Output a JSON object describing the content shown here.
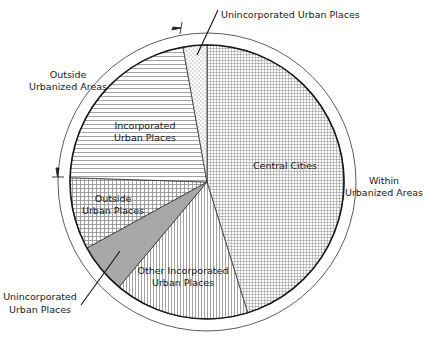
{
  "chart_data": {
    "type": "pie",
    "title": "",
    "start_angle_deg": 0,
    "direction": "clockwise",
    "slices": [
      {
        "label": "Central Cities",
        "value": 45.2,
        "pattern": "fine-grid",
        "group": "Within Urbanized Areas"
      },
      {
        "label": "Other Incorporated Urban Places",
        "value": 15.9,
        "pattern": "vertical-lines",
        "group": "Outside Urbanized Areas"
      },
      {
        "label": "Unincorporated Urban Places",
        "value": 5.9,
        "pattern": "solid-gray",
        "group": "Outside Urbanized Areas"
      },
      {
        "label": "Outside Urban Places",
        "value": 8.5,
        "pattern": "coarse-grid",
        "group": "Outside Urbanized Areas"
      },
      {
        "label": "Incorporated Urban Places",
        "value": 21.7,
        "pattern": "horizontal-lines",
        "group": "Within Urbanized Areas"
      },
      {
        "label": "Unincorporated Urban Places",
        "value": 2.8,
        "pattern": "dots",
        "group": "Within Urbanized Areas"
      }
    ],
    "group_labels": [
      {
        "label": "Within Urbanized Areas"
      },
      {
        "label": "Outside Urbanized Areas"
      }
    ],
    "legend": "none",
    "value_units": "percent (estimated from slice angles)"
  },
  "labels": {
    "central_cities": "Central Cities",
    "other_incorporated_l1": "Other Incorporated",
    "other_incorporated_l2": "Urban Places",
    "outside_urban_l1": "Outside",
    "outside_urban_l2": "Urban Places",
    "incorporated_l1": "Incorporated",
    "incorporated_l2": "Urban Places",
    "unincorporated_top": "Unincorporated Urban Places",
    "unincorporated_bottom_l1": "Unincorporated",
    "unincorporated_bottom_l2": "Urban Places",
    "within_l1": "Within",
    "within_l2": "Urbanized Areas",
    "outside_l1": "Outside",
    "outside_l2": "Urbanized Areas"
  },
  "colors": {
    "outline": "#1a1a1a",
    "pattern_ink": "#7a7a7a",
    "solid_gray": "#a8a8a8",
    "background": "#ffffff"
  }
}
